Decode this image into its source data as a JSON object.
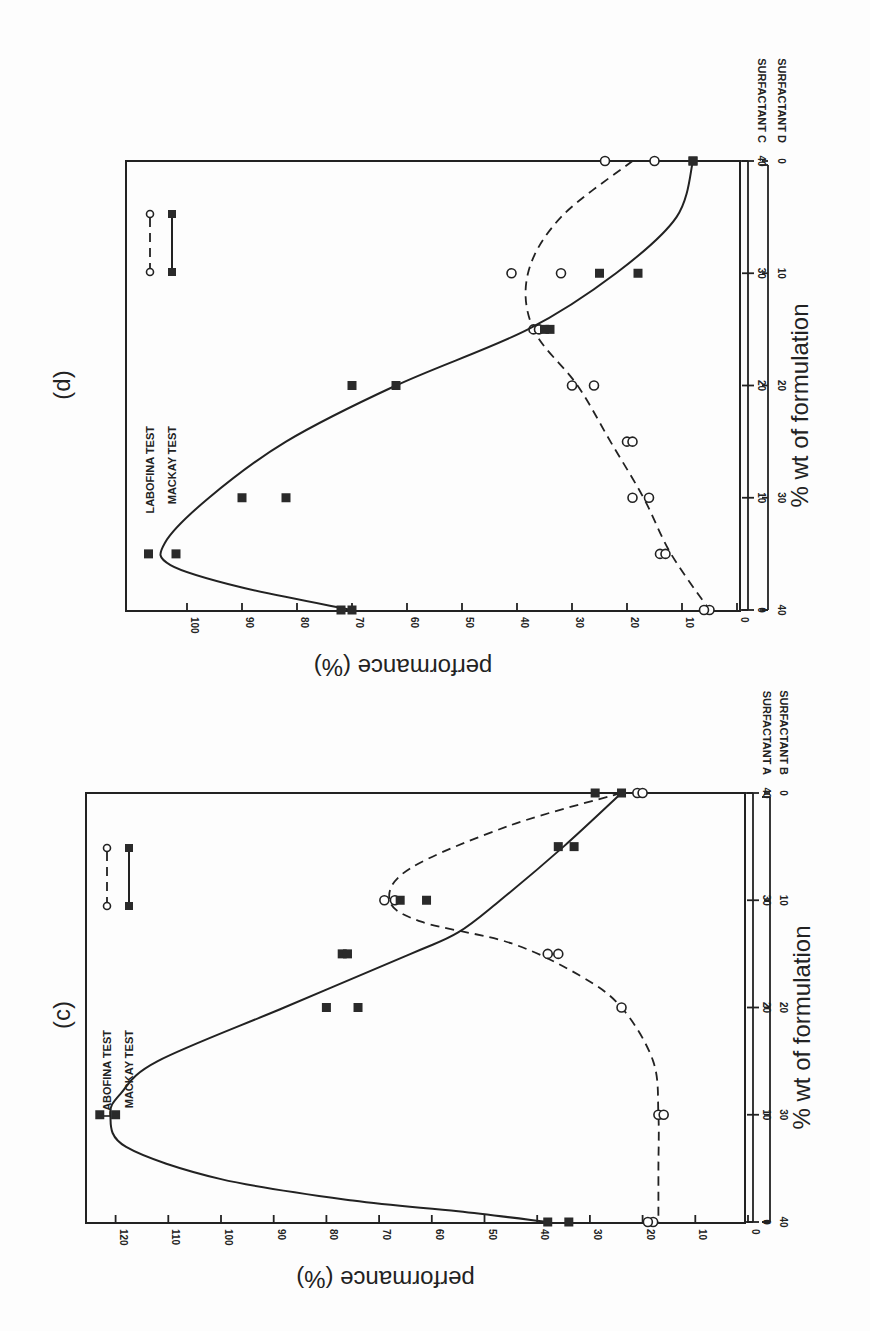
{
  "page": {
    "panels": [
      {
        "id": "d",
        "panel_label": "(d)",
        "ylabel": "performance (%)",
        "xlabel": "% wt of formulation",
        "surfactant_top": "SURFACTANT C",
        "surfactant_bottom": "SURFACTANT D",
        "legend": [
          {
            "label": "LABOFINA TEST",
            "style": "open-circle-dashed"
          },
          {
            "label": "MACKAY TEST",
            "style": "filled-square-solid"
          }
        ]
      },
      {
        "id": "c",
        "panel_label": "(c)",
        "ylabel": "performance (%)",
        "xlabel": "% wt of formulation",
        "surfactant_top": "SURFACTANT A",
        "surfactant_bottom": "SURFACTANT B",
        "legend": [
          {
            "label": "LABOFINA TEST",
            "style": "open-circle-dashed"
          },
          {
            "label": "MACKAY TEST",
            "style": "filled-square-solid"
          }
        ]
      }
    ]
  },
  "chart_data": [
    {
      "type": "scatter",
      "title": "(d)",
      "orientation": "page rotated 90°",
      "xlabel": "% wt of formulation",
      "x_primary_label": "SURFACTANT C",
      "x_secondary_label": "SURFACTANT D",
      "x_primary_ticks": [
        0,
        10,
        20,
        30,
        40
      ],
      "x_secondary_ticks": [
        40,
        30,
        20,
        10,
        0
      ],
      "ylabel": "performance (%)",
      "y_ticks": [
        0,
        10,
        20,
        30,
        40,
        50,
        60,
        70,
        80,
        90,
        100
      ],
      "ylim": [
        0,
        110
      ],
      "legend": [
        "LABOFINA TEST",
        "MACKAY TEST"
      ],
      "series": [
        {
          "name": "LABOFINA TEST",
          "marker": "open-circle",
          "line": "dashed",
          "points": [
            [
              40,
              24
            ],
            [
              40,
              15
            ],
            [
              30,
              41
            ],
            [
              30,
              32
            ],
            [
              25,
              37
            ],
            [
              25,
              36
            ],
            [
              20,
              30
            ],
            [
              20,
              26
            ],
            [
              15,
              20
            ],
            [
              15,
              19
            ],
            [
              10,
              19
            ],
            [
              10,
              16
            ],
            [
              5,
              14
            ],
            [
              5,
              13
            ],
            [
              0,
              5
            ],
            [
              0,
              6
            ]
          ],
          "curve": [
            [
              40,
              19
            ],
            [
              35,
              32
            ],
            [
              30,
              38
            ],
            [
              25,
              37
            ],
            [
              20,
              29
            ],
            [
              15,
              23
            ],
            [
              10,
              17
            ],
            [
              5,
              12
            ],
            [
              0,
              5
            ]
          ]
        },
        {
          "name": "MACKAY TEST",
          "marker": "filled-square",
          "line": "solid",
          "points": [
            [
              40,
              8
            ],
            [
              40,
              8
            ],
            [
              30,
              25
            ],
            [
              30,
              18
            ],
            [
              25,
              35
            ],
            [
              25,
              34
            ],
            [
              20,
              70
            ],
            [
              20,
              62
            ],
            [
              10,
              90
            ],
            [
              10,
              82
            ],
            [
              5,
              107
            ],
            [
              5,
              102
            ],
            [
              0,
              72
            ],
            [
              0,
              70
            ]
          ],
          "curve": [
            [
              40,
              8
            ],
            [
              35,
              11
            ],
            [
              30,
              22
            ],
            [
              25,
              38
            ],
            [
              20,
              62
            ],
            [
              15,
              82
            ],
            [
              10,
              96
            ],
            [
              6,
              104
            ],
            [
              4,
              103
            ],
            [
              2,
              90
            ],
            [
              0,
              70
            ]
          ]
        }
      ]
    },
    {
      "type": "scatter",
      "title": "(c)",
      "orientation": "page rotated 90°",
      "xlabel": "% wt of formulation",
      "x_primary_label": "SURFACTANT A",
      "x_secondary_label": "SURFACTANT B",
      "x_primary_ticks": [
        0,
        10,
        20,
        30,
        40
      ],
      "x_secondary_ticks": [
        40,
        30,
        20,
        10,
        0
      ],
      "ylabel": "performance (%)",
      "y_ticks": [
        0,
        10,
        20,
        30,
        40,
        50,
        60,
        70,
        80,
        90,
        100,
        110,
        120
      ],
      "ylim": [
        0,
        125
      ],
      "legend": [
        "LABOFINA TEST",
        "MACKAY TEST"
      ],
      "series": [
        {
          "name": "LABOFINA TEST",
          "marker": "open-circle",
          "line": "dashed",
          "points": [
            [
              40,
              21
            ],
            [
              40,
              20
            ],
            [
              30,
              69
            ],
            [
              30,
              67
            ],
            [
              25,
              38
            ],
            [
              25,
              36
            ],
            [
              20,
              24
            ],
            [
              10,
              17
            ],
            [
              10,
              16
            ],
            [
              0,
              18
            ],
            [
              0,
              19
            ]
          ],
          "curve": [
            [
              40,
              24
            ],
            [
              37,
              45
            ],
            [
              33,
              64
            ],
            [
              30,
              68
            ],
            [
              28,
              62
            ],
            [
              26,
              45
            ],
            [
              23,
              32
            ],
            [
              20,
              24
            ],
            [
              15,
              18
            ],
            [
              10,
              17
            ],
            [
              5,
              17
            ],
            [
              0,
              17
            ]
          ]
        },
        {
          "name": "MACKAY TEST",
          "marker": "filled-square",
          "line": "solid",
          "points": [
            [
              40,
              29
            ],
            [
              40,
              24
            ],
            [
              35,
              36
            ],
            [
              35,
              33
            ],
            [
              30,
              66
            ],
            [
              30,
              61
            ],
            [
              25,
              77
            ],
            [
              25,
              76
            ],
            [
              20,
              80
            ],
            [
              20,
              74
            ],
            [
              10,
              123
            ],
            [
              10,
              120
            ],
            [
              0,
              38
            ],
            [
              0,
              34
            ]
          ],
          "curve": [
            [
              40,
              24
            ],
            [
              35,
              35
            ],
            [
              30,
              47
            ],
            [
              27,
              55
            ],
            [
              25,
              64
            ],
            [
              20,
              88
            ],
            [
              15,
              112
            ],
            [
              12,
              119
            ],
            [
              10,
              121
            ],
            [
              7,
              118
            ],
            [
              4,
              100
            ],
            [
              2,
              75
            ],
            [
              1,
              55
            ],
            [
              0,
              38
            ]
          ]
        }
      ]
    }
  ]
}
